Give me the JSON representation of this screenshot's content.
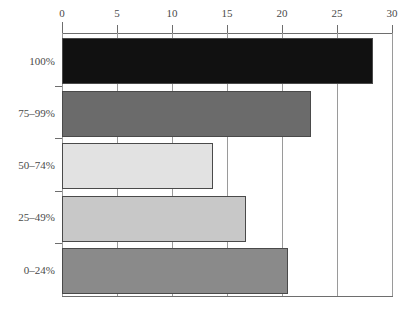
{
  "chart_data": {
    "type": "bar",
    "orientation": "horizontal",
    "title": "",
    "subtitle": "",
    "xlabel": "",
    "ylabel": "",
    "categories": [
      "100%",
      "75–99%",
      "50–74%",
      "25–49%",
      "0–24%"
    ],
    "values": [
      28.3,
      22.6,
      13.7,
      16.7,
      20.5
    ],
    "series": [
      {
        "name": "count",
        "values": [
          28.3,
          22.6,
          13.7,
          16.7,
          20.5
        ]
      }
    ],
    "bar_colors": [
      "#111111",
      "#6b6b6b",
      "#e2e2e2",
      "#c8c8c8",
      "#8a8a8a"
    ],
    "xlim": [
      0,
      30
    ],
    "x_ticks": [
      0,
      5,
      10,
      15,
      20,
      25,
      30
    ],
    "x_tick_labels": [
      "0",
      "5",
      "10",
      "15",
      "20",
      "25",
      "30"
    ],
    "grid": "vertical",
    "legend": "none",
    "axis_position": "top"
  },
  "style": {
    "axis_color": "#6e6e6e",
    "grid_color": "#9a9a9a",
    "bar_edge_color": "#4a4a4a",
    "text_color": "#4a4a4a",
    "background": "#ffffff"
  }
}
